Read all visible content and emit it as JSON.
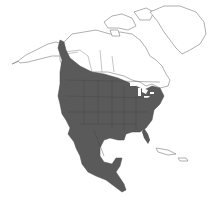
{
  "map": {
    "region": "North America",
    "type": "range map",
    "colors": {
      "background": "#ffffff",
      "land_outline": "#777777",
      "range_fill": "#5a5a5a",
      "border_lines": "#444444"
    },
    "range_label": "Shaded range"
  }
}
